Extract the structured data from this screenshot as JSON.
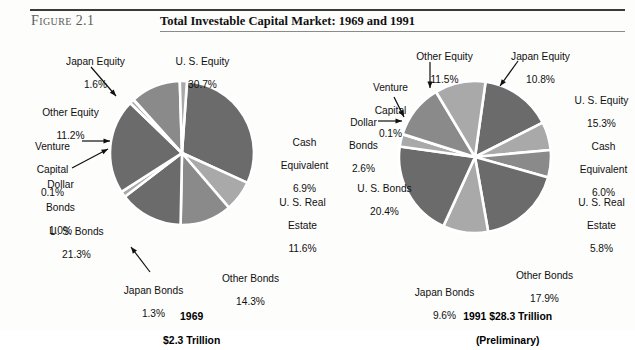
{
  "figure": {
    "label": "Figure 2.1",
    "title": "Total Investable Capital Market: 1969 and 1991"
  },
  "colors": {
    "dark_gray": "#6b6b6b",
    "light_gray": "#a9a9a9",
    "mid_gray": "#8a8a8a",
    "separator": "#ffffff",
    "text": "#101010",
    "rule": "#3a3a3a"
  },
  "chart_data": [
    {
      "type": "pie",
      "title": "1969",
      "subtitle": "$2.3 Trillion",
      "caption_line1": "1969",
      "caption_line2": "$2.3 Trillion",
      "categories": [
        "U. S. Equity",
        "Cash Equivalent",
        "U. S. Real Estate",
        "Other Bonds",
        "Japan Bonds",
        "U. S. Bonds",
        "Dollar Bonds",
        "Venture Capital",
        "Other Equity",
        "Japan Equity"
      ],
      "values": [
        30.7,
        6.9,
        11.6,
        14.3,
        1.3,
        21.3,
        1.0,
        0.1,
        11.2,
        1.6
      ],
      "value_labels": [
        "30.7%",
        "6.9%",
        "11.6%",
        "14.3%",
        "1.3%",
        "21.3%",
        "1.0%",
        "0.1%",
        "11.2%",
        "1.6%"
      ],
      "legend_position": "callout-labels",
      "labels": [
        {
          "name": "us-equity",
          "line1": "U. S. Equity",
          "line2": "30.7%"
        },
        {
          "name": "cash-equivalent",
          "line1": "Cash",
          "line2": "Equivalent",
          "line3": "6.9%"
        },
        {
          "name": "us-real-estate",
          "line1": "U. S. Real",
          "line2": "Estate",
          "line3": "11.6%"
        },
        {
          "name": "other-bonds",
          "line1": "Other Bonds",
          "line2": "14.3%"
        },
        {
          "name": "japan-bonds",
          "line1": "Japan Bonds",
          "line2": "1.3%"
        },
        {
          "name": "us-bonds",
          "line1": "U. S. Bonds",
          "line2": "21.3%"
        },
        {
          "name": "dollar-bonds",
          "line1": "Dollar",
          "line2": "Bonds",
          "line3": "1.0%"
        },
        {
          "name": "venture-capital",
          "line1": "Venture",
          "line2": "Capital",
          "line3": "0.1%"
        },
        {
          "name": "other-equity",
          "line1": "Other Equity",
          "line2": "11.2%"
        },
        {
          "name": "japan-equity",
          "line1": "Japan Equity",
          "line2": "1.6%"
        }
      ]
    },
    {
      "type": "pie",
      "title": "1991 $28.3 Trillion",
      "subtitle": "(Preliminary)",
      "caption_line1": "1991 $28.3 Trillion",
      "caption_line2": "(Preliminary)",
      "categories": [
        "U. S. Equity",
        "Cash Equivalent",
        "U. S. Real Estate",
        "Other Bonds",
        "Japan Bonds",
        "U. S. Bonds",
        "Dollar Bonds",
        "Venture Capital",
        "Other Equity",
        "Japan Equity"
      ],
      "values": [
        15.3,
        6.0,
        5.8,
        17.9,
        9.6,
        20.4,
        2.6,
        0.1,
        11.5,
        10.8
      ],
      "value_labels": [
        "15.3%",
        "6.0%",
        "5.8%",
        "17.9%",
        "9.6%",
        "20.4%",
        "2.6%",
        "0.1%",
        "11.5%",
        "10.8%"
      ],
      "legend_position": "callout-labels",
      "labels": [
        {
          "name": "us-equity",
          "line1": "U. S. Equity",
          "line2": "15.3%"
        },
        {
          "name": "cash-equivalent",
          "line1": "Cash",
          "line2": "Equivalent",
          "line3": "6.0%"
        },
        {
          "name": "us-real-estate",
          "line1": "U. S. Real",
          "line2": "Estate",
          "line3": "5.8%"
        },
        {
          "name": "other-bonds",
          "line1": "Other Bonds",
          "line2": "17.9%"
        },
        {
          "name": "japan-bonds",
          "line1": "Japan Bonds",
          "line2": "9.6%"
        },
        {
          "name": "us-bonds",
          "line1": "U. S. Bonds",
          "line2": "20.4%"
        },
        {
          "name": "dollar-bonds",
          "line1": "Dollar",
          "line2": "Bonds",
          "line3": "2.6%"
        },
        {
          "name": "venture-capital",
          "line1": "Venture",
          "line2": "Capital",
          "line3": "0.1%"
        },
        {
          "name": "other-equity",
          "line1": "Other Equity",
          "line2": "11.5%"
        },
        {
          "name": "japan-equity",
          "line1": "Japan Equity",
          "line2": "10.8%"
        }
      ]
    }
  ]
}
